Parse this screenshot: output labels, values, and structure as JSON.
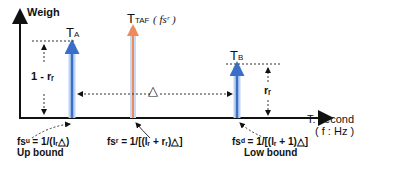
{
  "diagram": {
    "y_axis_label": "Weigh",
    "x_axis_label_line1": "T: second",
    "x_axis_label_line2": "( f : Hz )",
    "peaks": [
      {
        "id": "TA",
        "label_main": "T",
        "label_sub": "A",
        "color": "#3a6fc9"
      },
      {
        "id": "TTAF",
        "label_main": "T",
        "label_sub": "TAF",
        "label_suffix": "( fsʳ )",
        "color": "#f08a5b"
      },
      {
        "id": "TB",
        "label_main": "T",
        "label_sub": "B",
        "color": "#3a6fc9"
      }
    ],
    "height_labels": {
      "left": "1 - rᵣ",
      "right": "rᵣ"
    },
    "delta_label": "△",
    "formulas": [
      {
        "id": "up",
        "expr": "fsᵘ = 1/(lᵣ△)",
        "caption": "Up bound"
      },
      {
        "id": "mid",
        "expr": "fsʳ = 1/[(lᵣ + rᵣ)△]",
        "caption": ""
      },
      {
        "id": "low",
        "expr": "fsᵈ = 1/[(lᵣ + 1)△]",
        "caption": "Low bound"
      }
    ]
  }
}
